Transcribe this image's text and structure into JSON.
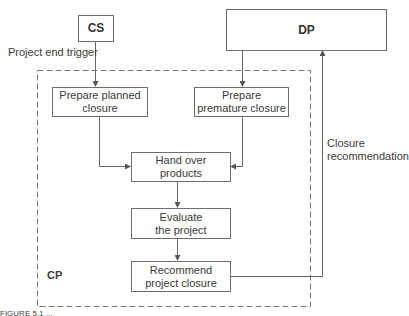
{
  "diagram": {
    "nodes": {
      "cs": {
        "label": "CS"
      },
      "dp": {
        "label": "DP"
      },
      "cp": {
        "label": "CP"
      },
      "prepare_planned": {
        "label": "Prepare planned closure"
      },
      "prepare_premature": {
        "label": "Prepare premature closure"
      },
      "hand_over": {
        "label": "Hand over products"
      },
      "evaluate": {
        "label": "Evaluate the project"
      },
      "recommend": {
        "label": "Recommend project closure"
      }
    },
    "edge_labels": {
      "project_end_trigger": "Project end trigger",
      "closure_recommendation": "Closure recommendation"
    },
    "edges": [
      {
        "from": "CS",
        "to": "Prepare planned closure",
        "label": "Project end trigger"
      },
      {
        "from": "DP",
        "to": "Prepare premature closure"
      },
      {
        "from": "Prepare planned closure",
        "to": "Hand over products"
      },
      {
        "from": "Prepare premature closure",
        "to": "Hand over products"
      },
      {
        "from": "Hand over products",
        "to": "Evaluate the project"
      },
      {
        "from": "Evaluate the project",
        "to": "Recommend project closure"
      },
      {
        "from": "Recommend project closure",
        "to": "DP",
        "label": "Closure recommendation"
      }
    ],
    "caption": "FIGURE 5.1 ..."
  },
  "text": {
    "prepare_planned_l1": "Prepare planned",
    "prepare_planned_l2": "closure",
    "prepare_premature_l1": "Prepare",
    "prepare_premature_l2": "premature closure",
    "hand_over_l1": "Hand over",
    "hand_over_l2": "products",
    "evaluate_l1": "Evaluate",
    "evaluate_l2": "the project",
    "recommend_l1": "Recommend",
    "recommend_l2": "project closure",
    "closure_rec_l1": "Closure",
    "closure_rec_l2": "recommendation"
  }
}
